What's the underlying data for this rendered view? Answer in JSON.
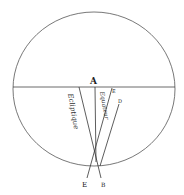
{
  "diagram": {
    "labels": {
      "A": "A",
      "E_top": "E",
      "D": "D",
      "E_bottom": "E",
      "B": "B"
    },
    "annotations": {
      "ecliptic": "Ecliptique",
      "equator": "Equateur"
    },
    "colors": {
      "ink": "#333333",
      "paper": "#ffffff"
    }
  }
}
